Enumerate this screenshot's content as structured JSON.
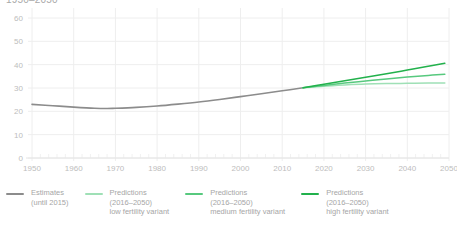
{
  "chart_title": "1950–2050",
  "colors": {
    "estimates": "#8c8c8c",
    "low": "#9fe0b6",
    "medium": "#57c97e",
    "high": "#22b14c",
    "grid": "#eeeeee",
    "tick_text": "#bdbdbd",
    "legend_text": "#a6a6a6"
  },
  "legend": {
    "items": [
      {
        "name": "estimates",
        "color": "#8c8c8c",
        "line1": "Estimates",
        "line2": "(until 2015)",
        "line3": ""
      },
      {
        "name": "low-fertility",
        "color": "#9fe0b6",
        "line1": "Predictions",
        "line2": "(2016–2050)",
        "line3": "low fertility variant"
      },
      {
        "name": "medium-fertility",
        "color": "#57c97e",
        "line1": "Predictions",
        "line2": "(2016–2050)",
        "line3": "medium fertility variant"
      },
      {
        "name": "high-fertility",
        "color": "#22b14c",
        "line1": "Predictions",
        "line2": "(2016–2050)",
        "line3": "high fertility variant"
      }
    ]
  },
  "chart_data": {
    "type": "line",
    "title": "1950–2050",
    "xlabel": "",
    "ylabel": "",
    "xlim": [
      1950,
      2050
    ],
    "ylim": [
      0,
      60
    ],
    "grid": true,
    "legend_position": "bottom",
    "xticks": [
      1950,
      1960,
      1970,
      1980,
      1990,
      2000,
      2010,
      2020,
      2030,
      2040,
      2050
    ],
    "yticks": [
      0,
      10,
      20,
      30,
      40,
      50,
      60
    ],
    "series": [
      {
        "name": "Estimates (until 2015)",
        "color": "#8c8c8c",
        "x": [
          1950,
          1955,
          1960,
          1965,
          1968,
          1970,
          1975,
          1980,
          1985,
          1990,
          1995,
          2000,
          2005,
          2010,
          2015
        ],
        "values": [
          23.0,
          22.4,
          21.8,
          21.3,
          21.2,
          21.3,
          21.7,
          22.3,
          23.1,
          24.0,
          25.1,
          26.3,
          27.5,
          28.8,
          30.1
        ]
      },
      {
        "name": "Predictions (2016–2050) low fertility variant",
        "color": "#9fe0b6",
        "x": [
          2015,
          2020,
          2025,
          2030,
          2035,
          2040,
          2045,
          2049
        ],
        "values": [
          30.1,
          30.8,
          31.3,
          31.7,
          31.9,
          32.0,
          32.1,
          32.1
        ]
      },
      {
        "name": "Predictions (2016–2050) medium fertility variant",
        "color": "#57c97e",
        "x": [
          2015,
          2020,
          2025,
          2030,
          2035,
          2040,
          2045,
          2049
        ],
        "values": [
          30.1,
          31.1,
          32.1,
          33.0,
          33.9,
          34.7,
          35.4,
          35.9
        ]
      },
      {
        "name": "Predictions (2016–2050) high fertility variant",
        "color": "#22b14c",
        "x": [
          2015,
          2020,
          2025,
          2030,
          2035,
          2040,
          2045,
          2049
        ],
        "values": [
          30.1,
          31.6,
          33.1,
          34.6,
          36.1,
          37.7,
          39.3,
          40.6
        ]
      }
    ]
  }
}
